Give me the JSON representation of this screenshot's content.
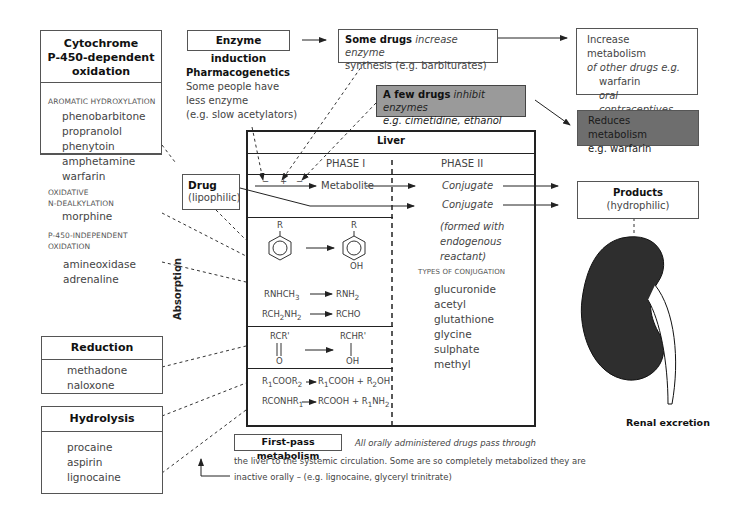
{
  "cyp450": {
    "title_lines": [
      "Cytochrome",
      "P-450-dependent",
      "oxidation"
    ],
    "sections": [
      {
        "caption": [
          "AROMATIC HYDROXYLATION"
        ],
        "drugs": [
          "phenobarbitone",
          "propranolol",
          "phenytoin",
          "amphetamine",
          "warfarin"
        ]
      },
      {
        "caption": [
          "OXIDATIVE",
          "N-DEALKYLATION"
        ],
        "drugs": [
          "morphine"
        ]
      },
      {
        "caption": [
          "P-450-INDEPENDENT",
          "OXIDATION"
        ],
        "drugs": [
          "amineoxidase",
          "adrenaline"
        ]
      }
    ]
  },
  "reduction": {
    "title": "Reduction",
    "drugs": [
      "methadone",
      "naloxone"
    ]
  },
  "hydrolysis": {
    "title": "Hydrolysis",
    "drugs": [
      "procaine",
      "aspirin",
      "lignocaine"
    ]
  },
  "enzyme_induction": {
    "label": "Enzyme induction"
  },
  "some_drugs": {
    "bold": "Some drugs",
    "italic": "increase enzyme",
    "line2": "synthesis (e.g. barbiturates)"
  },
  "increase_metabolism": {
    "lines": [
      "Increase metabolism",
      "of other drugs e.g.",
      "warfarin",
      "oral contraceptives"
    ]
  },
  "pharmacogenetics": {
    "title": "Pharmacogenetics",
    "lines": [
      "Some people have",
      "less enzyme",
      "(e.g. slow acetylators)"
    ]
  },
  "few_drugs": {
    "bold": "A few drugs",
    "italic": "inhibit enzymes",
    "line2": "e.g. cimetidine, ethanol"
  },
  "reduces_metabolism": {
    "lines": [
      "Reduces metabolism",
      "e.g. warfarin"
    ]
  },
  "drug": {
    "title": "Drug",
    "subtitle": "(lipophilic)"
  },
  "liver": {
    "title": "Liver",
    "phase1": "PHASE I",
    "phase2": "PHASE II",
    "signs": [
      "−",
      "+",
      "−"
    ],
    "metabolite": "Metabolite",
    "conjugate1": "Conjugate",
    "conjugate2": "Conjugate",
    "formed_with": [
      "(formed with",
      "endogenous",
      "reactant)"
    ],
    "types_caption": "TYPES OF CONJUGATION",
    "types": [
      "glucuronide",
      "acetyl",
      "glutathione",
      "glycine",
      "sulphate",
      "methyl"
    ],
    "chem": {
      "r_label": "R",
      "oh_label": "OH",
      "dealk_from": "RNHCH3",
      "dealk_to": "RNH2",
      "deam_from": "RCH2NH2",
      "deam_to": "RCHO",
      "red_from_top": "RCR'",
      "red_from_bot": "O",
      "red_to_top": "RCHR'",
      "red_to_bot": "OH",
      "hyd1_from": "R1COOR2",
      "hyd1_to": "R1COOH + R2OH",
      "hyd2_from": "RCONHR1",
      "hyd2_to": "RCOOH + R1NH2"
    }
  },
  "absorption": {
    "label": "Absorption"
  },
  "products": {
    "title": "Products",
    "subtitle": "(hydrophilic)"
  },
  "renal": {
    "label": "Renal excretion"
  },
  "first_pass": {
    "title": "First-pass metabolism",
    "line1": "All orally administered drugs pass through",
    "line2": "the liver to the systemic circulation.  Some are so completely metabolized they are",
    "line3": "inactive orally – (e.g. lignocaine, glyceryl trinitrate)"
  },
  "colors": {
    "inhibit_box": "#9a9a9a",
    "reduces_box": "#6e6e6e",
    "kidney": "#2e2e2e",
    "line": "#333333"
  }
}
